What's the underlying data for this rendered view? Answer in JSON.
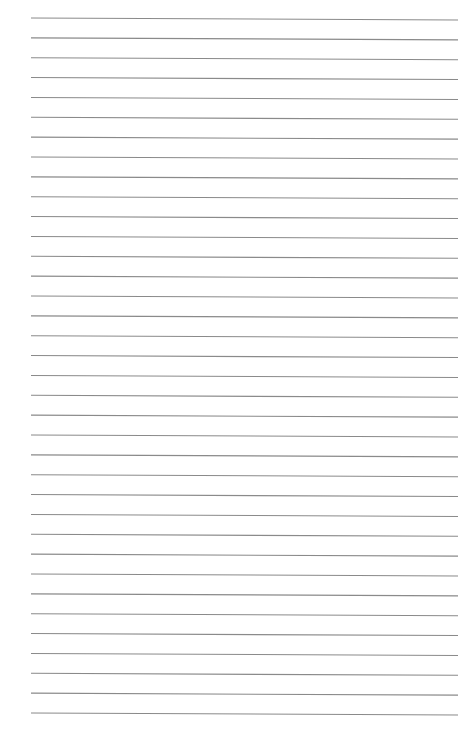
{
  "page": {
    "type": "ruled-paper",
    "background_color": "#ffffff",
    "line_color": "#8a8a8a",
    "line_count": 36,
    "first_line_y": 18,
    "last_line_y": 713,
    "line_left_x": 31,
    "line_right_x": 458,
    "right_end_drop": 2,
    "line_width": 1.1
  }
}
